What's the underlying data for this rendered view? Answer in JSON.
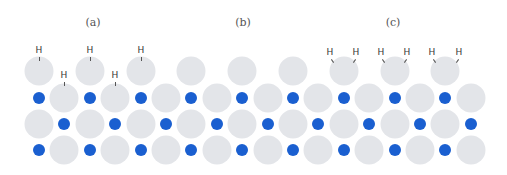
{
  "diagram": {
    "title": "",
    "colors": {
      "large_atom": "#e3e5e9",
      "small_atom": "#1a5fd0",
      "label": "#555555"
    },
    "panels": [
      {
        "id": "a",
        "label": "(a)",
        "label_x": 93,
        "label_y": 22
      },
      {
        "id": "b",
        "label": "(b)",
        "label_x": 243,
        "label_y": 22
      },
      {
        "id": "c",
        "label": "(c)",
        "label_x": 393,
        "label_y": 22
      }
    ],
    "grid": {
      "x0": 39,
      "dx": 25.4,
      "columns": 18,
      "row_y": [
        71,
        98,
        124,
        150
      ]
    },
    "top_row_large_columns": [
      0,
      2,
      4,
      6,
      8,
      10,
      12,
      14,
      16
    ],
    "hydrogens": [
      {
        "label": "H",
        "x": 39,
        "y": 50,
        "bond": "vertical"
      },
      {
        "label": "H",
        "x": 64,
        "y": 75,
        "bond": "vertical"
      },
      {
        "label": "H",
        "x": 90,
        "y": 50,
        "bond": "vertical"
      },
      {
        "label": "H",
        "x": 115,
        "y": 75,
        "bond": "vertical"
      },
      {
        "label": "H",
        "x": 141,
        "y": 50,
        "bond": "vertical"
      },
      {
        "label": "H",
        "x": 330,
        "y": 52,
        "bond": "right-down"
      },
      {
        "label": "H",
        "x": 356,
        "y": 52,
        "bond": "left-down"
      },
      {
        "label": "H",
        "x": 381,
        "y": 52,
        "bond": "right-down"
      },
      {
        "label": "H",
        "x": 407,
        "y": 52,
        "bond": "left-down"
      },
      {
        "label": "H",
        "x": 432,
        "y": 52,
        "bond": "right-down"
      },
      {
        "label": "H",
        "x": 459,
        "y": 52,
        "bond": "left-down"
      }
    ]
  }
}
